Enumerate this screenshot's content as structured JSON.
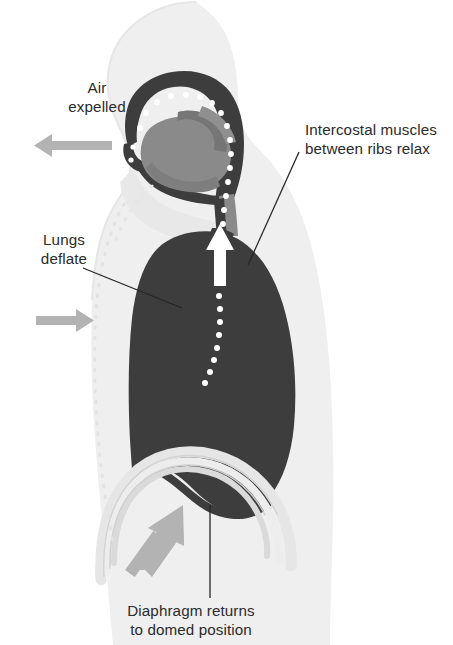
{
  "figure": {
    "width": 453,
    "height": 645,
    "background_color": "#ffffff"
  },
  "labels": {
    "air_expelled": "Air\nexpelled",
    "air_expelled_line1": "Air",
    "air_expelled_line2": "expelled",
    "intercostal_line1": "Intercostal muscles",
    "intercostal_line2": "between ribs relax",
    "lungs_deflate_line1": "Lungs",
    "lungs_deflate_line2": "deflate",
    "diaphragm_line1": "Diaphragm returns",
    "diaphragm_line2": "to domed position"
  },
  "colors": {
    "background": "#ffffff",
    "body_silhouette": "#efefef",
    "body_silhouette_edge": "#e4e4e4",
    "lung_dark": "#3d3d3d",
    "airway_dark": "#3d3d3d",
    "tongue_gray": "#8a8a8a",
    "arrow_gray": "#b3b3b3",
    "diaphragm_arc_light": "#e8e8e8",
    "diaphragm_arc_mid": "#d6d6d6",
    "air_dot_white": "#ffffff",
    "leader_line": "#262626",
    "text": "#2b2b2b",
    "ribcage_dotted": "#e0e0e0"
  },
  "anatomy": {
    "parts": [
      {
        "name": "head-and-torso-silhouette",
        "fill": "#efefef"
      },
      {
        "name": "nasal-cavity-and-pharynx",
        "fill": "#3d3d3d"
      },
      {
        "name": "tongue",
        "fill": "#8a8a8a"
      },
      {
        "name": "trachea",
        "fill": "#3d3d3d"
      },
      {
        "name": "lung",
        "fill": "#3d3d3d"
      },
      {
        "name": "diaphragm-domed-arcs",
        "count": 3
      },
      {
        "name": "previous-ribcage-outline",
        "style": "dotted"
      }
    ]
  },
  "arrows": {
    "air_out": {
      "direction": "left",
      "color": "#b3b3b3"
    },
    "ribs_inward": {
      "direction": "right",
      "color": "#b3b3b3"
    },
    "diaphragm_up": {
      "direction": "up-right",
      "color": "#b3b3b3"
    },
    "airflow_up_trachea": {
      "direction": "up",
      "color": "#ffffff"
    }
  },
  "airflow": {
    "dot_color": "#ffffff",
    "description": "dotted air path from lung through trachea and out through nose"
  }
}
